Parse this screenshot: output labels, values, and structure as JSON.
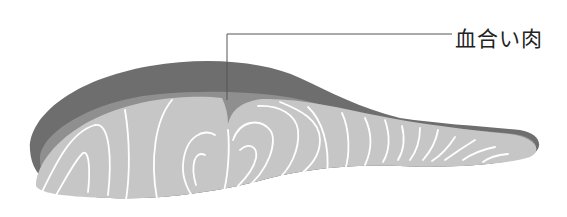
{
  "diagram": {
    "labels": [
      {
        "text": "血合い肉",
        "target": "dark-meat-region"
      }
    ],
    "colors": {
      "skin": "#6e6e6e",
      "dark_meat": "#8f8f8f",
      "flesh": "#c6c6c6",
      "muscle_lines": "#ffffff",
      "leader_line": "#555555"
    }
  }
}
